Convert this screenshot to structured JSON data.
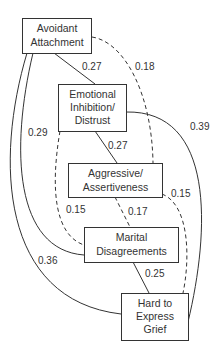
{
  "diagram": {
    "type": "path-diagram",
    "nodes": {
      "avoidant": {
        "line1": "Avoidant",
        "line2": "Attachment"
      },
      "emotional": {
        "line1": "Emotional",
        "line2": "Inhibition/",
        "line3": "Distrust"
      },
      "aggressive": {
        "line1": "Aggressive/",
        "line2": "Assertiveness"
      },
      "marital": {
        "line1": "Marital",
        "line2": "Disagreements"
      },
      "grief": {
        "line1": "Hard to",
        "line2": "Express",
        "line3": "Grief"
      }
    },
    "edges": [
      {
        "from": "Avoidant Attachment",
        "to": "Emotional Inhibition/Distrust",
        "coef": "0.27",
        "style": "solid"
      },
      {
        "from": "Avoidant Attachment",
        "to": "Aggressive/Assertiveness",
        "coef": "0.18",
        "style": "dashed"
      },
      {
        "from": "Avoidant Attachment",
        "to": "Marital Disagreements",
        "coef": "0.29",
        "style": "solid"
      },
      {
        "from": "Avoidant Attachment",
        "to": "Hard to Express Grief",
        "coef": "0.36",
        "style": "solid"
      },
      {
        "from": "Emotional Inhibition/Distrust",
        "to": "Aggressive/Assertiveness",
        "coef": "0.27",
        "style": "solid"
      },
      {
        "from": "Emotional Inhibition/Distrust",
        "to": "Hard to Express Grief",
        "coef": "0.39",
        "style": "solid"
      },
      {
        "from": "Emotional Inhibition/Distrust",
        "to": "Marital Disagreements",
        "coef": "0.15",
        "style": "dashed"
      },
      {
        "from": "Aggressive/Assertiveness",
        "to": "Marital Disagreements",
        "coef": "0.17",
        "style": "dashed"
      },
      {
        "from": "Aggressive/Assertiveness",
        "to": "Hard to Express Grief",
        "coef": "0.15",
        "style": "dashed"
      },
      {
        "from": "Marital Disagreements",
        "to": "Hard to Express Grief",
        "coef": "0.25",
        "style": "solid"
      }
    ],
    "labels": {
      "av_em": "0.27",
      "av_ag": "0.18",
      "av_ma": "0.29",
      "av_gr": "0.36",
      "em_ag": "0.27",
      "em_gr": "0.39",
      "em_ma": "0.15",
      "ag_ma": "0.17",
      "ag_gr": "0.15",
      "ma_gr": "0.25"
    }
  }
}
